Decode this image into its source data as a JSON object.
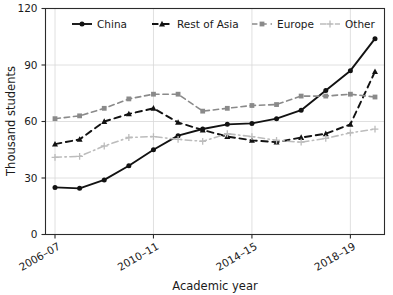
{
  "chart_data": {
    "type": "line",
    "title": "",
    "xlabel": "Academic year",
    "ylabel": "Thousand students",
    "ylim": [
      0,
      120
    ],
    "yticks": [
      0,
      30,
      60,
      90,
      120
    ],
    "ytick_labels": [
      "0",
      "30",
      "60",
      "90",
      "120"
    ],
    "grid": true,
    "grid_axis": "both",
    "legend_position": "top-center-inside",
    "x": [
      "2006–07",
      "2007–08",
      "2008–09",
      "2009–10",
      "2010–11",
      "2011–12",
      "2012–13",
      "2013–14",
      "2014–15",
      "2015–16",
      "2016–17",
      "2017–18",
      "2018–19",
      "2019–20"
    ],
    "xtick_labels": [
      "2006–07",
      "2010–11",
      "2014–15",
      "2018–19"
    ],
    "xtick_indices": [
      0,
      4,
      8,
      12
    ],
    "series": [
      {
        "name": "China",
        "color": "#121212",
        "dash": "none",
        "marker": "circle",
        "values": [
          25,
          24.5,
          29,
          36.5,
          45,
          52.5,
          56,
          58.5,
          59,
          61.5,
          66,
          76.5,
          87,
          104
        ]
      },
      {
        "name": "Rest of Asia",
        "color": "#121212",
        "dash": "dashed",
        "marker": "triangle",
        "values": [
          48,
          50.5,
          60,
          64,
          67,
          59.5,
          55.5,
          52,
          50,
          49,
          51.5,
          53.5,
          58.5,
          86.5
        ]
      },
      {
        "name": "Europe",
        "color": "#8a8a8a",
        "dash": "dashed",
        "marker": "square",
        "values": [
          61.5,
          63,
          67,
          72,
          74.5,
          74.5,
          65.5,
          67,
          68.5,
          69,
          73.5,
          73.5,
          74.5,
          73
        ]
      },
      {
        "name": "Other",
        "color": "#bcbcbc",
        "dash": "dashdot",
        "marker": "plus",
        "values": [
          41,
          41.5,
          47,
          51.5,
          52,
          50.5,
          49.5,
          53.5,
          52,
          50,
          49,
          51,
          54,
          56
        ]
      }
    ]
  },
  "legend": {
    "entries": [
      {
        "label": "China"
      },
      {
        "label": "Rest of Asia"
      },
      {
        "label": "Europe"
      },
      {
        "label": "Other"
      }
    ]
  }
}
